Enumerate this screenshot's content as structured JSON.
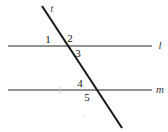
{
  "figure": {
    "background_color": "#ffffff",
    "line_color": "#6e6e6e",
    "transversal_color": "#1c1c1c",
    "label_color": "#141414"
  },
  "lines": {
    "upper": {
      "name": "l",
      "x1": 8,
      "y1": 46,
      "x2": 152,
      "y2": 46
    },
    "lower": {
      "name": "m",
      "x1": 8,
      "y1": 90,
      "x2": 152,
      "y2": 90,
      "tick_x": 60
    },
    "transversal": {
      "name": "t",
      "x1": 42,
      "y1": 6,
      "x2": 122,
      "y2": 128
    }
  },
  "intersections": {
    "upper": {
      "x": 66,
      "y": 46
    },
    "lower": {
      "x": 95,
      "y": 90
    }
  },
  "angles": [
    {
      "id": "angle-1",
      "label": "1",
      "x": 48,
      "y": 39
    },
    {
      "id": "angle-2",
      "label": "2",
      "x": 70,
      "y": 38
    },
    {
      "id": "angle-3",
      "label": "3",
      "x": 78,
      "y": 53
    },
    {
      "id": "angle-4",
      "label": "4",
      "x": 80,
      "y": 83
    },
    {
      "id": "angle-5",
      "label": "5",
      "x": 87,
      "y": 97
    }
  ],
  "line_labels": [
    {
      "id": "line-label-l",
      "label": "l",
      "x": 160,
      "y": 45
    },
    {
      "id": "line-label-m",
      "label": "m",
      "x": 160,
      "y": 89
    },
    {
      "id": "line-label-t",
      "label": "t",
      "x": 52,
      "y": 9
    }
  ],
  "artifacts": [
    {
      "id": "scan-smudge",
      "label": "s",
      "x": 84,
      "y": 115
    }
  ]
}
